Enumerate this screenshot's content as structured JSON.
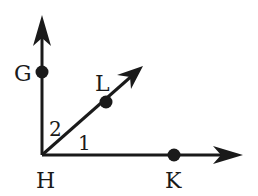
{
  "diagram": {
    "type": "geometry-angles",
    "colors": {
      "stroke": "#1a1a1a",
      "background": "#ffffff"
    },
    "vertex": {
      "label": "H",
      "x": 42,
      "y": 155
    },
    "points": [
      {
        "id": "G",
        "label": "G",
        "x": 42,
        "y": 72
      },
      {
        "id": "L",
        "label": "L",
        "x": 106,
        "y": 102
      },
      {
        "id": "K",
        "label": "K",
        "x": 174,
        "y": 155
      }
    ],
    "rays": [
      {
        "id": "HG",
        "from": "H",
        "through": "G",
        "tip": {
          "x": 42,
          "y": 16
        }
      },
      {
        "id": "HL",
        "from": "H",
        "through": "L",
        "tip": {
          "x": 143,
          "y": 66
        }
      },
      {
        "id": "HK",
        "from": "H",
        "through": "K",
        "tip": {
          "x": 243,
          "y": 155
        }
      }
    ],
    "angles": [
      {
        "label": "2",
        "between": [
          "HG",
          "HL"
        ]
      },
      {
        "label": "1",
        "between": [
          "HL",
          "HK"
        ]
      }
    ]
  }
}
